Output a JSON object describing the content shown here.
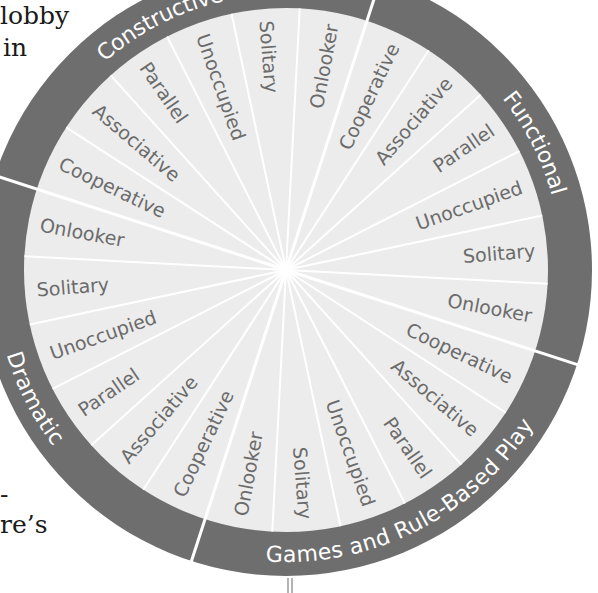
{
  "page_fragments": {
    "top_left_line1": "lobby",
    "top_left_line2": "in",
    "bottom_left_line1": "-",
    "bottom_left_line2": "re’s"
  },
  "wheel": {
    "title": "",
    "colors": {
      "ring": "#6e6e6e",
      "disk": "#ececec",
      "divider": "#ffffff",
      "wedge_text": "#6b6b6b",
      "category_text": "#ffffff"
    },
    "categories": [
      {
        "label": "Functional",
        "wedges": [
          "Cooperative",
          "Associative",
          "Parallel",
          "Unoccupied",
          "Solitary",
          "Onlooker"
        ]
      },
      {
        "label": "Games and Rule-Based Play",
        "wedges": [
          "Cooperative",
          "Associative",
          "Parallel",
          "Unoccupied",
          "Solitary",
          "Onlooker"
        ]
      },
      {
        "label": "Dramatic",
        "wedges": [
          "Cooperative",
          "Associative",
          "Parallel",
          "Unoccupied",
          "Solitary",
          "Onlooker"
        ]
      },
      {
        "label": "Constructive",
        "wedges": [
          "Cooperative",
          "Associative",
          "Parallel",
          "Unoccupied",
          "Solitary",
          "Onlooker"
        ]
      }
    ]
  }
}
